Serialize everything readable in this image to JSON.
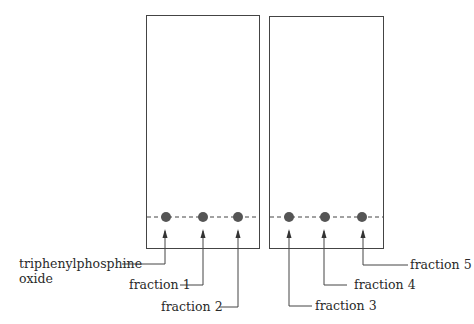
{
  "figure": {
    "plates": [
      {
        "id": "left",
        "x": 146,
        "y": 15,
        "width": 113,
        "height": 233
      },
      {
        "id": "right",
        "x": 269,
        "y": 16,
        "width": 114,
        "height": 232
      }
    ],
    "baseline_y": 217,
    "spot_color": "#555555",
    "line_color": "#444444",
    "spots": [
      {
        "label": "triphenylphosphine",
        "label2": "oxide",
        "x": 166
      },
      {
        "label": "fraction 1",
        "x": 203
      },
      {
        "label": "fraction 2",
        "x": 238
      },
      {
        "label": "fraction 3",
        "x": 289
      },
      {
        "label": "fraction 4",
        "x": 325
      },
      {
        "label": "fraction 5",
        "x": 362
      }
    ]
  }
}
